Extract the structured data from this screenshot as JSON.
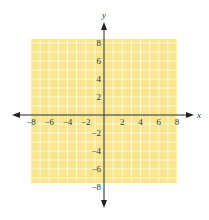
{
  "diagram": {
    "type": "coordinate-plane",
    "x_axis": {
      "label": "x",
      "min": -8,
      "max": 8,
      "tick_labels": [
        "−8",
        "−6",
        "−4",
        "−2",
        "2",
        "4",
        "6",
        "8"
      ],
      "tick_values": [
        -8,
        -6,
        -4,
        -2,
        2,
        4,
        6,
        8
      ]
    },
    "y_axis": {
      "label": "y",
      "min": -8,
      "max": 8,
      "tick_labels": [
        "8",
        "6",
        "4",
        "2",
        "−2",
        "−4",
        "−6",
        "−8"
      ],
      "tick_values": [
        8,
        6,
        4,
        2,
        -2,
        -4,
        -6,
        -8
      ]
    },
    "grid": {
      "step": 1,
      "fill_color": "#f7e68f",
      "line_color": "#fffbe6"
    },
    "axis_color": "#222222"
  }
}
